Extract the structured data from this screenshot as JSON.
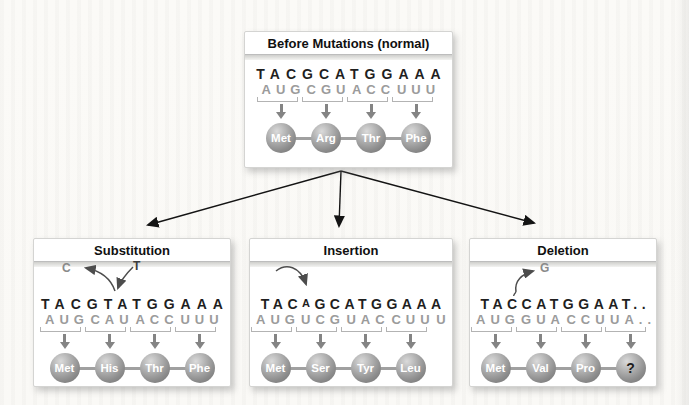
{
  "colors": {
    "dna_text": "#1f1f1f",
    "mrna_text": "#9b9b9b",
    "bracket": "#b3b3b3",
    "codon_arrow": "#848484",
    "sphere_light": "#dadada",
    "sphere_dark": "#6e6e6e",
    "bond": "#a0a0a0",
    "panel_border": "#d4d4d2",
    "branch_arrow": "#141414",
    "annotation_gray": "#8a8a8a"
  },
  "panels": {
    "before": {
      "title": "Before Mutations (normal)",
      "dna": "TACGCATGGAAA",
      "mrna_codons": [
        "AUG",
        "CGU",
        "ACC",
        "UUU"
      ],
      "amino_acids": [
        "Met",
        "Arg",
        "Thr",
        "Phe"
      ]
    },
    "substitution": {
      "title": "Substitution",
      "dna": "TACGTATGGAAA",
      "mrna_codons": [
        "AUG",
        "CAU",
        "ACC",
        "UUU"
      ],
      "amino_acids": [
        "Met",
        "His",
        "Thr",
        "Phe"
      ],
      "annotation": {
        "removed_base": "C",
        "added_base": "T"
      }
    },
    "insertion": {
      "title": "Insertion",
      "dna_before_insert": "TAC",
      "inserted_base": "A",
      "dna_after_insert": "GCATGGAAA",
      "mrna_codons": [
        "AUG",
        "UCG",
        "UAC",
        "CUU"
      ],
      "mrna_overflow": "U",
      "amino_acids": [
        "Met",
        "Ser",
        "Tyr",
        "Leu"
      ]
    },
    "deletion": {
      "title": "Deletion",
      "dna": "TACCATGGAAT..",
      "mrna_codons": [
        "AUG",
        "GUA",
        "CCU",
        "UA.."
      ],
      "amino_acids": [
        "Met",
        "Val",
        "Pro",
        "?"
      ],
      "annotation": {
        "removed_base": "G"
      }
    }
  }
}
